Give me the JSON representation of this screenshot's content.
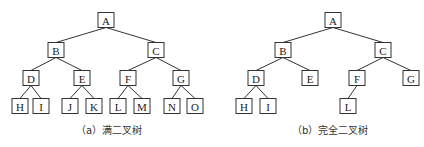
{
  "figures": [
    {
      "id": "a",
      "caption": "（a）满二叉树",
      "caption_x": 76,
      "nodes": [
        {
          "label": "A",
          "x": 106,
          "y": 20
        },
        {
          "label": "B",
          "x": 56,
          "y": 50
        },
        {
          "label": "C",
          "x": 156,
          "y": 50
        },
        {
          "label": "D",
          "x": 31,
          "y": 78
        },
        {
          "label": "E",
          "x": 82,
          "y": 78
        },
        {
          "label": "F",
          "x": 128,
          "y": 78
        },
        {
          "label": "G",
          "x": 181,
          "y": 78
        },
        {
          "label": "H",
          "x": 20,
          "y": 106
        },
        {
          "label": "I",
          "x": 41,
          "y": 106
        },
        {
          "label": "J",
          "x": 70,
          "y": 106
        },
        {
          "label": "K",
          "x": 94,
          "y": 106
        },
        {
          "label": "L",
          "x": 118,
          "y": 106
        },
        {
          "label": "M",
          "x": 142,
          "y": 106
        },
        {
          "label": "N",
          "x": 172,
          "y": 106
        },
        {
          "label": "O",
          "x": 195,
          "y": 106
        }
      ],
      "edges": [
        [
          "A",
          "B"
        ],
        [
          "A",
          "C"
        ],
        [
          "B",
          "D"
        ],
        [
          "B",
          "E"
        ],
        [
          "C",
          "F"
        ],
        [
          "C",
          "G"
        ],
        [
          "D",
          "H"
        ],
        [
          "D",
          "I"
        ],
        [
          "E",
          "J"
        ],
        [
          "E",
          "K"
        ],
        [
          "F",
          "L"
        ],
        [
          "F",
          "M"
        ],
        [
          "G",
          "N"
        ],
        [
          "G",
          "O"
        ]
      ]
    },
    {
      "id": "b",
      "caption": "（b）完全二叉树",
      "caption_x": 292,
      "nodes": [
        {
          "label": "A",
          "x": 333,
          "y": 20
        },
        {
          "label": "B",
          "x": 283,
          "y": 50
        },
        {
          "label": "C",
          "x": 383,
          "y": 50
        },
        {
          "label": "D",
          "x": 256,
          "y": 78
        },
        {
          "label": "E",
          "x": 310,
          "y": 78
        },
        {
          "label": "F",
          "x": 357,
          "y": 78
        },
        {
          "label": "G",
          "x": 411,
          "y": 78
        },
        {
          "label": "H",
          "x": 244,
          "y": 106
        },
        {
          "label": "I",
          "x": 268,
          "y": 106
        },
        {
          "label": "L",
          "x": 348,
          "y": 106
        }
      ],
      "edges": [
        [
          "A",
          "B"
        ],
        [
          "A",
          "C"
        ],
        [
          "B",
          "D"
        ],
        [
          "B",
          "E"
        ],
        [
          "C",
          "F"
        ],
        [
          "C",
          "G"
        ],
        [
          "D",
          "H"
        ],
        [
          "D",
          "I"
        ],
        [
          "F",
          "L"
        ]
      ]
    }
  ]
}
